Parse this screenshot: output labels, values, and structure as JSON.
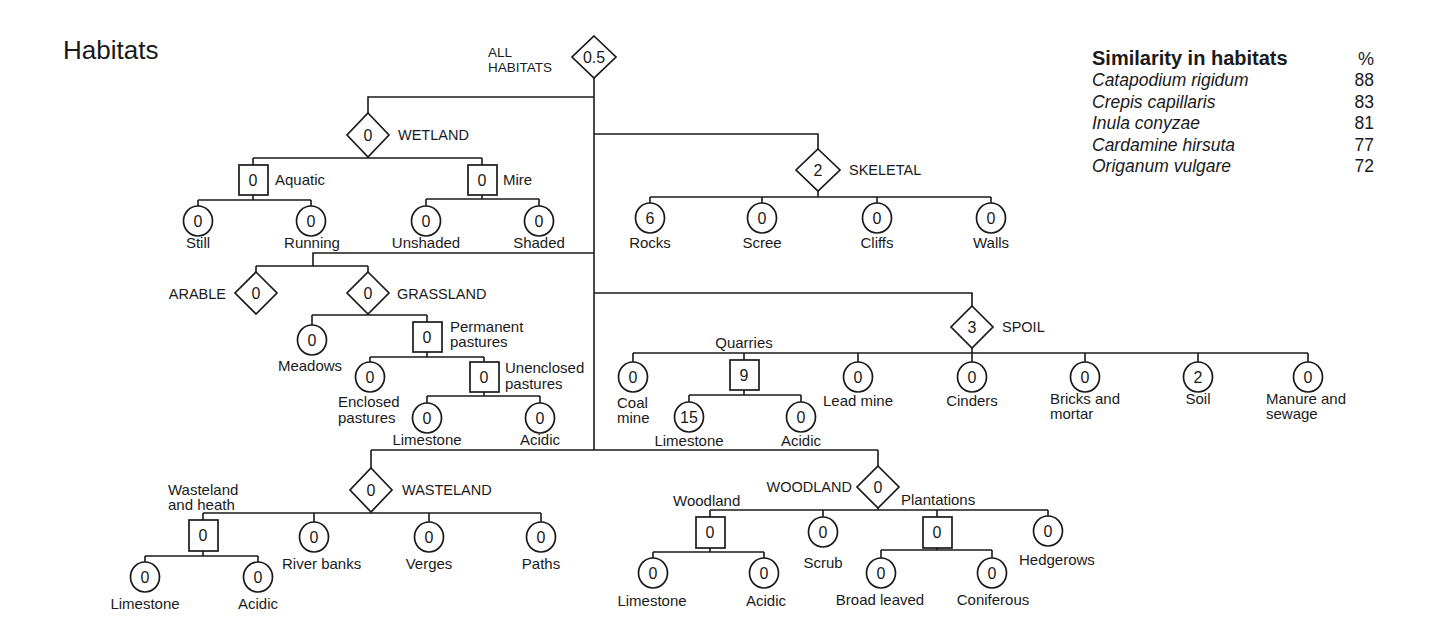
{
  "title": "Habitats",
  "colors": {
    "ink": "#1a1a1a",
    "background": "#ffffff"
  },
  "tree": {
    "root": {
      "label_lines": [
        "ALL",
        "HABITATS"
      ],
      "value": "0.5",
      "shape": "diamond"
    },
    "wetland": {
      "label": "WETLAND",
      "value": "0",
      "shape": "diamond",
      "children": [
        {
          "label": "Aquatic",
          "value": "0",
          "shape": "square",
          "children": [
            {
              "label": "Still",
              "value": "0",
              "shape": "circle"
            },
            {
              "label": "Running",
              "value": "0",
              "shape": "circle"
            }
          ]
        },
        {
          "label": "Mire",
          "value": "0",
          "shape": "square",
          "children": [
            {
              "label": "Unshaded",
              "value": "0",
              "shape": "circle"
            },
            {
              "label": "Shaded",
              "value": "0",
              "shape": "circle"
            }
          ]
        }
      ]
    },
    "skeletal": {
      "label": "SKELETAL",
      "value": "2",
      "shape": "diamond",
      "children": [
        {
          "label": "Rocks",
          "value": "6",
          "shape": "circle"
        },
        {
          "label": "Scree",
          "value": "0",
          "shape": "circle"
        },
        {
          "label": "Cliffs",
          "value": "0",
          "shape": "circle"
        },
        {
          "label": "Walls",
          "value": "0",
          "shape": "circle"
        }
      ]
    },
    "arable": {
      "label": "ARABLE",
      "value": "0",
      "shape": "diamond"
    },
    "grassland": {
      "label": "GRASSLAND",
      "value": "0",
      "shape": "diamond",
      "children": [
        {
          "label": "Meadows",
          "value": "0",
          "shape": "circle"
        },
        {
          "label_lines": [
            "Permanent",
            "pastures"
          ],
          "value": "0",
          "shape": "square",
          "children": [
            {
              "label_lines": [
                "Enclosed",
                "pastures"
              ],
              "value": "0",
              "shape": "circle"
            },
            {
              "label_lines": [
                "Unenclosed",
                "pastures"
              ],
              "value": "0",
              "shape": "square",
              "children": [
                {
                  "label": "Limestone",
                  "value": "0",
                  "shape": "circle"
                },
                {
                  "label": "Acidic",
                  "value": "0",
                  "shape": "circle"
                }
              ]
            }
          ]
        }
      ]
    },
    "spoil": {
      "label": "SPOIL",
      "value": "3",
      "shape": "diamond",
      "children": [
        {
          "label_lines": [
            "Coal",
            "mine"
          ],
          "value": "0",
          "shape": "circle"
        },
        {
          "label": "Quarries",
          "value": "9",
          "shape": "square",
          "children": [
            {
              "label": "Limestone",
              "value": "15",
              "shape": "circle"
            },
            {
              "label": "Acidic",
              "value": "0",
              "shape": "circle"
            }
          ]
        },
        {
          "label": "Lead mine",
          "value": "0",
          "shape": "circle"
        },
        {
          "label": "Cinders",
          "value": "0",
          "shape": "circle"
        },
        {
          "label_lines": [
            "Bricks and",
            "mortar"
          ],
          "value": "0",
          "shape": "circle"
        },
        {
          "label": "Soil",
          "value": "2",
          "shape": "circle"
        },
        {
          "label_lines": [
            "Manure and",
            "sewage"
          ],
          "value": "0",
          "shape": "circle"
        }
      ]
    },
    "wasteland": {
      "label": "WASTELAND",
      "value": "0",
      "shape": "diamond",
      "children": [
        {
          "label_lines": [
            "Wasteland",
            "and heath"
          ],
          "value": "0",
          "shape": "square",
          "children": [
            {
              "label": "Limestone",
              "value": "0",
              "shape": "circle"
            },
            {
              "label": "Acidic",
              "value": "0",
              "shape": "circle"
            }
          ]
        },
        {
          "label": "River banks",
          "value": "0",
          "shape": "circle"
        },
        {
          "label": "Verges",
          "value": "0",
          "shape": "circle"
        },
        {
          "label": "Paths",
          "value": "0",
          "shape": "circle"
        }
      ]
    },
    "woodland": {
      "label": "WOODLAND",
      "value": "0",
      "shape": "diamond",
      "children": [
        {
          "label": "Woodland",
          "value": "0",
          "shape": "square",
          "children": [
            {
              "label": "Limestone",
              "value": "0",
              "shape": "circle"
            },
            {
              "label": "Acidic",
              "value": "0",
              "shape": "circle"
            }
          ]
        },
        {
          "label": "Scrub",
          "value": "0",
          "shape": "circle"
        },
        {
          "label": "Plantations",
          "value": "0",
          "shape": "square",
          "children": [
            {
              "label": "Broad leaved",
              "value": "0",
              "shape": "circle"
            },
            {
              "label": "Coniferous",
              "value": "0",
              "shape": "circle"
            }
          ]
        },
        {
          "label": "Hedgerows",
          "value": "0",
          "shape": "circle"
        }
      ]
    }
  },
  "similarity_table": {
    "title": "Similarity in habitats",
    "unit_header": "%",
    "rows": [
      {
        "species": "Catapodium rigidum",
        "percent": "88"
      },
      {
        "species": "Crepis capillaris",
        "percent": "83"
      },
      {
        "species": "Inula conyzae",
        "percent": "81"
      },
      {
        "species": "Cardamine hirsuta",
        "percent": "77"
      },
      {
        "species": "Origanum vulgare",
        "percent": "72"
      }
    ]
  }
}
